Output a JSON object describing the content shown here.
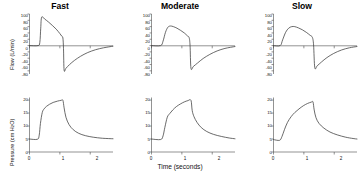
{
  "figure": {
    "xlabel": "Time (seconds)",
    "columns": [
      {
        "key": "fast",
        "title": "Fast"
      },
      {
        "key": "moderate",
        "title": "Moderate"
      },
      {
        "key": "slow",
        "title": "Slow"
      }
    ],
    "rows": [
      {
        "key": "flow",
        "ylabel_text": "Flow (L/min)"
      },
      {
        "key": "pressure",
        "ylabel_pre": "Pressure (cm H",
        "ylabel_sub": "2",
        "ylabel_post": "O)"
      }
    ]
  },
  "chart_data": [
    {
      "type": "line",
      "panel": "flow-fast",
      "title": "Fast",
      "xlabel": "Time (seconds)",
      "ylabel": "Flow (L/min)",
      "xlim": [
        0,
        2.75
      ],
      "ylim": [
        -90,
        100
      ],
      "yticks": [
        100,
        80,
        60,
        40,
        20,
        0,
        -20,
        -40,
        -60,
        -80
      ],
      "ytick_labels": [
        "100",
        "80",
        "60",
        "40",
        "20",
        "0",
        "-20",
        "-40",
        "-60",
        "-80"
      ],
      "xticks": [
        0,
        1,
        2
      ],
      "xtick_labels": [],
      "grid": false,
      "legend": "none",
      "series": [
        {
          "name": "Flow",
          "x": [
            0.0,
            0.28,
            0.34,
            0.37,
            0.4,
            0.5,
            0.62,
            0.75,
            0.88,
            1.0,
            1.06,
            1.1,
            1.12,
            1.14,
            1.2,
            1.32,
            1.48,
            1.68,
            1.92,
            2.18,
            2.44,
            2.75
          ],
          "y": [
            0,
            0,
            10,
            55,
            90,
            84,
            75,
            64,
            52,
            38,
            30,
            24,
            -10,
            -78,
            -72,
            -60,
            -47,
            -34,
            -22,
            -13,
            -7,
            -2
          ]
        }
      ]
    },
    {
      "type": "line",
      "panel": "flow-moderate",
      "title": "Moderate",
      "xlabel": "Time (seconds)",
      "ylabel": "Flow (L/min)",
      "xlim": [
        0,
        2.75
      ],
      "ylim": [
        -90,
        100
      ],
      "yticks": [
        100,
        80,
        60,
        40,
        20,
        0,
        -20,
        -40,
        -60,
        -80
      ],
      "ytick_labels": [
        "100",
        "80",
        "60",
        "40",
        "20",
        "0",
        "-20",
        "-40",
        "-60",
        "-80"
      ],
      "xticks": [
        0,
        1,
        2
      ],
      "xtick_labels": [],
      "grid": false,
      "legend": "none",
      "series": [
        {
          "name": "Flow",
          "x": [
            0.0,
            0.3,
            0.38,
            0.46,
            0.54,
            0.62,
            0.72,
            0.84,
            0.96,
            1.08,
            1.18,
            1.24,
            1.27,
            1.3,
            1.38,
            1.52,
            1.7,
            1.92,
            2.16,
            2.42,
            2.75
          ],
          "y": [
            0,
            0,
            14,
            42,
            58,
            62,
            60,
            55,
            48,
            40,
            31,
            25,
            0,
            -72,
            -66,
            -55,
            -41,
            -28,
            -17,
            -9,
            -3
          ]
        }
      ]
    },
    {
      "type": "line",
      "panel": "flow-slow",
      "title": "Slow",
      "xlabel": "Time (seconds)",
      "ylabel": "Flow (L/min)",
      "xlim": [
        0,
        2.75
      ],
      "ylim": [
        -90,
        100
      ],
      "yticks": [
        100,
        80,
        60,
        40,
        20,
        0,
        -20,
        -40,
        -60,
        -80
      ],
      "ytick_labels": [
        "100",
        "80",
        "60",
        "40",
        "20",
        "0",
        "-20",
        "-40",
        "-60",
        "-80"
      ],
      "xticks": [
        0,
        1,
        2
      ],
      "xtick_labels": [],
      "grid": false,
      "legend": "none",
      "series": [
        {
          "name": "Flow",
          "x": [
            0.0,
            0.22,
            0.3,
            0.4,
            0.5,
            0.6,
            0.7,
            0.82,
            0.95,
            1.08,
            1.2,
            1.28,
            1.32,
            1.36,
            1.44,
            1.58,
            1.76,
            1.98,
            2.24,
            2.5,
            2.75
          ],
          "y": [
            0,
            0,
            18,
            42,
            55,
            60,
            60,
            56,
            50,
            42,
            33,
            26,
            2,
            -70,
            -64,
            -52,
            -38,
            -25,
            -14,
            -7,
            -3
          ]
        }
      ]
    },
    {
      "type": "line",
      "panel": "pressure-fast",
      "title": "Fast",
      "xlabel": "Time (seconds)",
      "ylabel": "Pressure (cm H2O)",
      "xlim": [
        0,
        2.75
      ],
      "ylim": [
        0,
        21
      ],
      "yticks": [
        0,
        5,
        10,
        15,
        20
      ],
      "ytick_labels": [
        "0",
        "5",
        "10",
        "15",
        "20"
      ],
      "xticks": [
        0,
        1,
        2
      ],
      "xtick_labels": [
        "0",
        "1",
        "2"
      ],
      "grid": false,
      "legend": "none",
      "series": [
        {
          "name": "Pressure",
          "x": [
            0.0,
            0.26,
            0.32,
            0.36,
            0.42,
            0.48,
            0.56,
            0.66,
            0.78,
            0.92,
            1.04,
            1.1,
            1.14,
            1.2,
            1.3,
            1.44,
            1.62,
            1.84,
            2.1,
            2.4,
            2.75
          ],
          "y": [
            5.0,
            4.9,
            6.5,
            11.0,
            15.2,
            16.6,
            17.6,
            18.4,
            19.1,
            19.6,
            19.9,
            19.9,
            17.0,
            13.4,
            10.6,
            8.6,
            7.2,
            6.3,
            5.7,
            5.3,
            5.1
          ]
        }
      ]
    },
    {
      "type": "line",
      "panel": "pressure-moderate",
      "title": "Moderate",
      "xlabel": "Time (seconds)",
      "ylabel": "Pressure (cm H2O)",
      "xlim": [
        0,
        2.75
      ],
      "ylim": [
        0,
        21
      ],
      "yticks": [
        0,
        5,
        10,
        15,
        20
      ],
      "ytick_labels": [
        "0",
        "5",
        "10",
        "15",
        "20"
      ],
      "xticks": [
        0,
        1,
        2
      ],
      "xtick_labels": [
        "0",
        "1",
        "2"
      ],
      "grid": false,
      "legend": "none",
      "series": [
        {
          "name": "Pressure",
          "x": [
            0.0,
            0.3,
            0.38,
            0.44,
            0.52,
            0.6,
            0.7,
            0.82,
            0.95,
            1.08,
            1.2,
            1.3,
            1.34,
            1.4,
            1.5,
            1.64,
            1.82,
            2.04,
            2.3,
            2.56,
            2.75
          ],
          "y": [
            5.0,
            4.8,
            6.2,
            9.5,
            13.4,
            14.8,
            16.2,
            17.5,
            18.5,
            19.3,
            19.8,
            19.9,
            16.0,
            13.6,
            11.4,
            9.4,
            7.9,
            6.8,
            6.0,
            5.4,
            5.1
          ]
        }
      ]
    },
    {
      "type": "line",
      "panel": "pressure-slow",
      "title": "Slow",
      "xlabel": "Time (seconds)",
      "ylabel": "Pressure (cm H2O)",
      "xlim": [
        0,
        2.75
      ],
      "ylim": [
        0,
        21
      ],
      "yticks": [
        0,
        5,
        10,
        15,
        20
      ],
      "ytick_labels": [
        "0",
        "5",
        "10",
        "15",
        "20"
      ],
      "xticks": [
        0,
        1,
        2
      ],
      "xtick_labels": [
        "0",
        "1",
        "2"
      ],
      "grid": false,
      "legend": "none",
      "series": [
        {
          "name": "Pressure",
          "x": [
            0.0,
            0.2,
            0.28,
            0.36,
            0.46,
            0.58,
            0.7,
            0.84,
            0.98,
            1.12,
            1.24,
            1.3,
            1.34,
            1.4,
            1.5,
            1.66,
            1.86,
            2.1,
            2.38,
            2.62,
            2.75
          ],
          "y": [
            4.8,
            4.5,
            6.0,
            8.6,
            11.4,
            13.6,
            15.2,
            16.6,
            17.8,
            18.7,
            19.2,
            19.3,
            16.2,
            13.2,
            11.0,
            9.2,
            7.7,
            6.6,
            5.7,
            5.2,
            5.0
          ]
        }
      ]
    }
  ]
}
